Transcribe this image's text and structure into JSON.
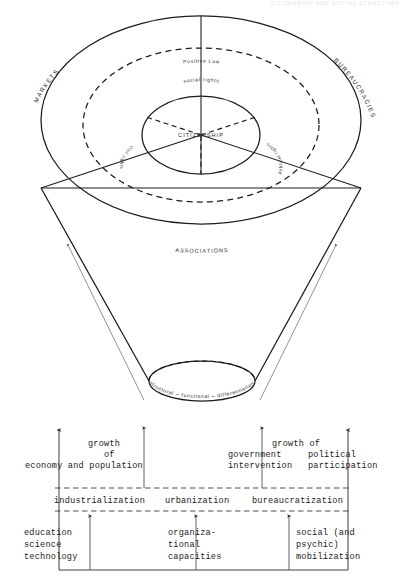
{
  "page": {
    "running_head": "CITIZENSHIP AND SOCIAL STRUCTURE",
    "background_color": "#ffffff",
    "ink_color": "#1c1c1c"
  },
  "diagram": {
    "type": "cone-and-concentric-rings",
    "center_label": "CITIZENSHIP",
    "rings": [
      {
        "name": "inner-ring",
        "style": "solid",
        "label": ""
      },
      {
        "name": "middle-ring",
        "style": "dashed",
        "label": "Positive Law"
      },
      {
        "name": "outer-ring",
        "style": "solid",
        "label": "ASSOCIATIONS"
      }
    ],
    "ring_labels": {
      "positive_law": "Positive Law",
      "associations": "ASSOCIATIONS"
    },
    "rights_labels": {
      "social": "social  rights",
      "civil": "civil rights",
      "political": "political rights"
    },
    "flank_labels": {
      "left": "MARKETS",
      "right": "BUREAUCRACIES"
    },
    "base_label": "structural – functional – differentiation"
  },
  "table": {
    "rows": [
      {
        "name": "growth-row",
        "cells": [
          {
            "name": "growth-economy",
            "lines": [
              "growth",
              "of",
              "economy and population"
            ],
            "align": "center"
          },
          {
            "name": "growth-government",
            "lines": [
              "growth of",
              "government",
              "intervention"
            ],
            "align": "right"
          },
          {
            "name": "growth-political",
            "lines": [
              "",
              "political",
              "participation"
            ],
            "align": "left"
          }
        ]
      },
      {
        "name": "process-row",
        "cells": [
          {
            "name": "process-industrialization",
            "lines": [
              "industrialization"
            ],
            "align": "center"
          },
          {
            "name": "process-urbanization",
            "lines": [
              "urbanization"
            ],
            "align": "center"
          },
          {
            "name": "process-bureaucratization",
            "lines": [
              "bureaucratization"
            ],
            "align": "center"
          }
        ]
      },
      {
        "name": "resource-row",
        "cells": [
          {
            "name": "resource-education",
            "lines": [
              "education",
              "science",
              "technology"
            ],
            "align": "left"
          },
          {
            "name": "resource-organizational",
            "lines": [
              "organiza-",
              "tional",
              "capacities"
            ],
            "align": "left"
          },
          {
            "name": "resource-mobilization",
            "lines": [
              "social (and",
              "psychic)",
              "mobilization"
            ],
            "align": "left"
          }
        ]
      }
    ]
  }
}
